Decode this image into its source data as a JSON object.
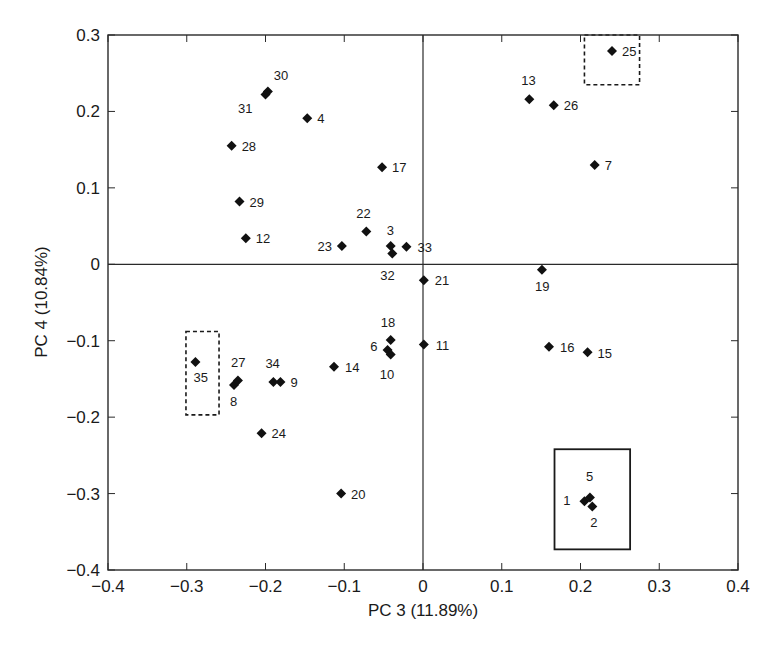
{
  "chart_data": {
    "type": "scatter",
    "title": "",
    "xlabel": "PC 3 (11.89%)",
    "ylabel": "PC 4 (10.84%)",
    "xlim": [
      -0.4,
      0.4
    ],
    "ylim": [
      -0.4,
      0.3
    ],
    "x_ticks": [
      -0.4,
      -0.3,
      -0.2,
      -0.1,
      0,
      0.1,
      0.2,
      0.3,
      0.4
    ],
    "x_tick_labels": [
      "−0.4",
      "−0.3",
      "−0.2",
      "−0.1",
      "0",
      "0.1",
      "0.2",
      "0.3",
      "0.4"
    ],
    "y_ticks": [
      0.3,
      0.2,
      0.1,
      0,
      -0.1,
      -0.2,
      -0.3,
      -0.4
    ],
    "y_tick_labels": [
      "0.3",
      "0.2",
      "0.1",
      "0",
      "−0.1",
      "−0.2",
      "−0.3",
      "−0.4"
    ],
    "grid": false,
    "zero_lines": true,
    "marker": "diamond",
    "marker_color": "#111111",
    "points": [
      {
        "label": "1",
        "x": 0.205,
        "y": -0.31,
        "lx": -14,
        "ly": 4,
        "anchor": "end"
      },
      {
        "label": "2",
        "x": 0.215,
        "y": -0.317,
        "lx": -2,
        "ly": 20,
        "anchor": "start"
      },
      {
        "label": "3",
        "x": -0.041,
        "y": 0.024,
        "lx": -4,
        "ly": -11,
        "anchor": "start"
      },
      {
        "label": "4",
        "x": -0.147,
        "y": 0.191,
        "lx": 10,
        "ly": 5,
        "anchor": "start"
      },
      {
        "label": "5",
        "x": 0.212,
        "y": -0.305,
        "lx": -4,
        "ly": -16,
        "anchor": "start"
      },
      {
        "label": "6",
        "x": -0.045,
        "y": -0.112,
        "lx": -10,
        "ly": 1,
        "anchor": "end"
      },
      {
        "label": "7",
        "x": 0.218,
        "y": 0.13,
        "lx": 10,
        "ly": 5,
        "anchor": "start"
      },
      {
        "label": "8",
        "x": -0.24,
        "y": -0.158,
        "lx": -4,
        "ly": 21,
        "anchor": "start"
      },
      {
        "label": "9",
        "x": -0.181,
        "y": -0.154,
        "lx": 10,
        "ly": 5,
        "anchor": "start"
      },
      {
        "label": "10",
        "x": -0.041,
        "y": -0.118,
        "lx": -11,
        "ly": 25,
        "anchor": "start"
      },
      {
        "label": "11",
        "x": 0.001,
        "y": -0.105,
        "lx": 12,
        "ly": 5,
        "anchor": "start"
      },
      {
        "label": "12",
        "x": -0.225,
        "y": 0.034,
        "lx": 10,
        "ly": 5,
        "anchor": "start"
      },
      {
        "label": "13",
        "x": 0.135,
        "y": 0.216,
        "lx": -8,
        "ly": -14,
        "anchor": "start"
      },
      {
        "label": "14",
        "x": -0.113,
        "y": -0.134,
        "lx": 11,
        "ly": 5,
        "anchor": "start"
      },
      {
        "label": "15",
        "x": 0.209,
        "y": -0.115,
        "lx": 10,
        "ly": 6,
        "anchor": "start"
      },
      {
        "label": "16",
        "x": 0.16,
        "y": -0.108,
        "lx": 11,
        "ly": 5,
        "anchor": "start"
      },
      {
        "label": "17",
        "x": -0.052,
        "y": 0.127,
        "lx": 10,
        "ly": 5,
        "anchor": "start"
      },
      {
        "label": "18",
        "x": -0.041,
        "y": -0.099,
        "lx": -10,
        "ly": -13,
        "anchor": "start"
      },
      {
        "label": "19",
        "x": 0.151,
        "y": -0.007,
        "lx": -7,
        "ly": 21,
        "anchor": "start"
      },
      {
        "label": "20",
        "x": -0.104,
        "y": -0.3,
        "lx": 10,
        "ly": 5,
        "anchor": "start"
      },
      {
        "label": "21",
        "x": 0.001,
        "y": -0.021,
        "lx": 11,
        "ly": 5,
        "anchor": "start"
      },
      {
        "label": "22",
        "x": -0.072,
        "y": 0.043,
        "lx": -10,
        "ly": -13,
        "anchor": "start"
      },
      {
        "label": "23",
        "x": -0.103,
        "y": 0.024,
        "lx": -10,
        "ly": 5,
        "anchor": "end"
      },
      {
        "label": "24",
        "x": -0.205,
        "y": -0.221,
        "lx": 10,
        "ly": 5,
        "anchor": "start"
      },
      {
        "label": "25",
        "x": 0.24,
        "y": 0.279,
        "lx": 10,
        "ly": 5,
        "anchor": "start"
      },
      {
        "label": "26",
        "x": 0.166,
        "y": 0.208,
        "lx": 10,
        "ly": 5,
        "anchor": "start"
      },
      {
        "label": "27",
        "x": -0.235,
        "y": -0.152,
        "lx": -7,
        "ly": -13,
        "anchor": "start"
      },
      {
        "label": "28",
        "x": -0.243,
        "y": 0.155,
        "lx": 10,
        "ly": 5,
        "anchor": "start"
      },
      {
        "label": "29",
        "x": -0.233,
        "y": 0.082,
        "lx": 10,
        "ly": 5,
        "anchor": "start"
      },
      {
        "label": "30",
        "x": -0.197,
        "y": 0.226,
        "lx": 6,
        "ly": -12,
        "anchor": "start"
      },
      {
        "label": "31",
        "x": -0.2,
        "y": 0.222,
        "lx": -13,
        "ly": 18,
        "anchor": "end"
      },
      {
        "label": "32",
        "x": -0.039,
        "y": 0.014,
        "lx": -12,
        "ly": 26,
        "anchor": "start"
      },
      {
        "label": "33",
        "x": -0.021,
        "y": 0.023,
        "lx": 11,
        "ly": 5,
        "anchor": "start"
      },
      {
        "label": "34",
        "x": -0.19,
        "y": -0.154,
        "lx": -8,
        "ly": -14,
        "anchor": "start"
      },
      {
        "label": "35",
        "x": -0.289,
        "y": -0.128,
        "lx": -2,
        "ly": 20,
        "anchor": "start"
      }
    ],
    "annotations": [
      {
        "type": "rect",
        "style": "dashed",
        "x0": 0.205,
        "x1": 0.275,
        "y0": 0.235,
        "y1": 0.3,
        "encloses": [
          "25"
        ]
      },
      {
        "type": "rect",
        "style": "dashed",
        "x0": -0.301,
        "x1": -0.259,
        "y0": -0.197,
        "y1": -0.088,
        "encloses": [
          "35"
        ]
      },
      {
        "type": "rect",
        "style": "solid",
        "x0": 0.167,
        "x1": 0.263,
        "y0": -0.373,
        "y1": -0.242,
        "encloses": [
          "1",
          "2",
          "5"
        ]
      }
    ]
  }
}
